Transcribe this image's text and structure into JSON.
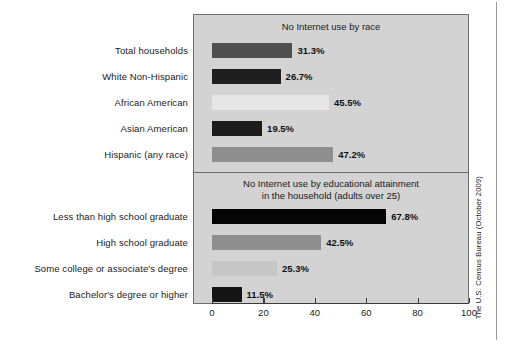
{
  "source_credit": "The U.S. Census Bureau (October 2009)",
  "axis": {
    "ticks": [
      0,
      20,
      40,
      60,
      80,
      100
    ],
    "tick_labels": [
      "0",
      "20",
      "40",
      "60",
      "80",
      "100"
    ],
    "min": 0,
    "max": 100
  },
  "panels": [
    {
      "id": "race",
      "title": "No Internet use by race",
      "bars": [
        {
          "label": "Total households",
          "value": 31.3,
          "value_label": "31.3%",
          "color": "#4f4f4f"
        },
        {
          "label": "White Non-Hispanic",
          "value": 26.7,
          "value_label": "26.7%",
          "color": "#1f1f1f"
        },
        {
          "label": "African American",
          "value": 45.5,
          "value_label": "45.5%",
          "color": "#e6e6e6"
        },
        {
          "label": "Asian American",
          "value": 19.5,
          "value_label": "19.5%",
          "color": "#1c1c1c"
        },
        {
          "label": "Hispanic (any race)",
          "value": 47.2,
          "value_label": "47.2%",
          "color": "#8e8e8e"
        }
      ]
    },
    {
      "id": "education",
      "title": "No Internet use by educational attainment\nin the household (adults over 25)",
      "bars": [
        {
          "label": "Less than high school graduate",
          "value": 67.8,
          "value_label": "67.8%",
          "color": "#050505"
        },
        {
          "label": "High school graduate",
          "value": 42.5,
          "value_label": "42.5%",
          "color": "#8e8e8e"
        },
        {
          "label": "Some college or associate's degree",
          "value": 25.3,
          "value_label": "25.3%",
          "color": "#c6c6c6"
        },
        {
          "label": "Bachelor's degree or higher",
          "value": 11.5,
          "value_label": "11.5%",
          "color": "#141414"
        }
      ]
    }
  ],
  "chart_data": {
    "type": "bar",
    "orientation": "horizontal",
    "title": "",
    "xlabel": "",
    "ylabel": "",
    "xlim": [
      0,
      100
    ],
    "grid": false,
    "legend": false,
    "panels": [
      {
        "title": "No Internet use by race",
        "categories": [
          "Total households",
          "White Non-Hispanic",
          "African American",
          "Asian American",
          "Hispanic (any race)"
        ],
        "values": [
          31.3,
          26.7,
          45.5,
          19.5,
          47.2
        ],
        "value_labels": [
          "31.3%",
          "26.7%",
          "45.5%",
          "19.5%",
          "47.2%"
        ]
      },
      {
        "title": "No Internet use by educational attainment in the household (adults over 25)",
        "categories": [
          "Less than high school graduate",
          "High school graduate",
          "Some college or associate's degree",
          "Bachelor's degree or higher"
        ],
        "values": [
          67.8,
          42.5,
          25.3,
          11.5
        ],
        "value_labels": [
          "67.8%",
          "42.5%",
          "25.3%",
          "11.5%"
        ]
      }
    ],
    "xticks": [
      0,
      20,
      40,
      60,
      80,
      100
    ],
    "source": "The U.S. Census Bureau (October 2009)"
  }
}
